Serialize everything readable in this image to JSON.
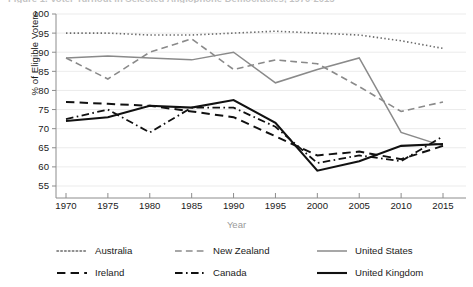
{
  "chart_data": {
    "type": "line",
    "title": "Figure 1. Voter Turnout in Selected Anglophone Democracies, 1970-2015",
    "xlabel": "Year",
    "ylabel": "% of Eligible Voters",
    "x": [
      1970,
      1975,
      1980,
      1985,
      1990,
      1995,
      2000,
      2005,
      2010,
      2015
    ],
    "xticks": [
      "1970",
      "1975",
      "1980",
      "1985",
      "1990",
      "1995",
      "2000",
      "2005",
      "2010",
      "2015"
    ],
    "yticks": [
      "55",
      "60",
      "65",
      "70",
      "75",
      "80",
      "85",
      "90",
      "95",
      "100"
    ],
    "xlim": [
      1968,
      2017
    ],
    "ylim": [
      55,
      100
    ],
    "grid": true,
    "legend_position": "bottom",
    "series": [
      {
        "name": "Australia",
        "style": "dotted",
        "color": "#6b6b6b",
        "width": 1.6,
        "values": [
          95.0,
          95.0,
          94.5,
          94.5,
          95.0,
          95.5,
          95.0,
          94.5,
          93.0,
          91.0
        ]
      },
      {
        "name": "New Zealand",
        "style": "dashed",
        "color": "#8a8a8a",
        "width": 1.6,
        "values": [
          88.5,
          83.0,
          90.0,
          93.5,
          85.5,
          88.0,
          87.0,
          81.0,
          74.5,
          77.0
        ]
      },
      {
        "name": "United States",
        "style": "solid",
        "color": "#8a8a8a",
        "width": 1.5,
        "values": [
          88.5,
          89.0,
          88.5,
          88.0,
          90.0,
          82.0,
          85.5,
          88.5,
          69.0,
          65.5
        ]
      },
      {
        "name": "Ireland",
        "style": "dashed",
        "color": "#111111",
        "width": 2.0,
        "values": [
          77.0,
          76.5,
          76.0,
          74.5,
          73.0,
          68.0,
          63.0,
          64.0,
          62.0,
          65.5
        ]
      },
      {
        "name": "Canada",
        "style": "dashdot",
        "color": "#111111",
        "width": 1.8,
        "values": [
          72.5,
          75.0,
          69.0,
          75.5,
          75.5,
          70.5,
          61.0,
          63.0,
          61.5,
          68.0
        ]
      },
      {
        "name": "United Kingdom",
        "style": "solid",
        "color": "#111111",
        "width": 2.1,
        "values": [
          72.0,
          73.0,
          76.0,
          75.5,
          77.5,
          71.5,
          59.0,
          61.5,
          65.5,
          66.0
        ]
      }
    ]
  }
}
